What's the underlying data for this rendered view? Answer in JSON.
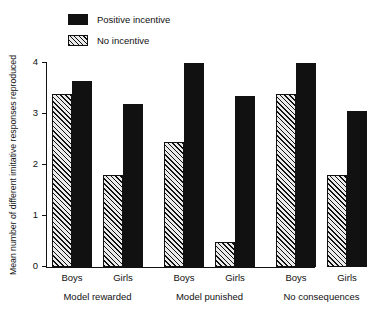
{
  "chart_data": {
    "type": "bar",
    "title": "",
    "subtitle": "",
    "xlabel": "",
    "ylabel": "Mean number of different imitative responses reproduced",
    "ylim": [
      0,
      4
    ],
    "yticks": [
      0,
      1,
      2,
      3,
      4
    ],
    "ytick_labels": [
      "0",
      "1",
      "2",
      "3",
      "4"
    ],
    "grid": false,
    "legend_position": "top-left",
    "categories": [
      "Boys",
      "Girls",
      "Boys",
      "Girls",
      "Boys",
      "Girls"
    ],
    "groups": [
      {
        "label": "Model rewarded",
        "subgroups": [
          {
            "label": "Boys",
            "no_incentive": 3.4,
            "positive_incentive": 3.65
          },
          {
            "label": "Girls",
            "no_incentive": 1.8,
            "positive_incentive": 3.2
          }
        ]
      },
      {
        "label": "Model punished",
        "subgroups": [
          {
            "label": "Boys",
            "no_incentive": 2.45,
            "positive_incentive": 4.0
          },
          {
            "label": "Girls",
            "no_incentive": 0.5,
            "positive_incentive": 3.35
          }
        ]
      },
      {
        "label": "No consequences",
        "subgroups": [
          {
            "label": "Boys",
            "no_incentive": 3.4,
            "positive_incentive": 4.0
          },
          {
            "label": "Girls",
            "no_incentive": 1.8,
            "positive_incentive": 3.05
          }
        ]
      }
    ],
    "series": [
      {
        "name": "No incentive",
        "pattern": "hatched",
        "color": "#ebebeb",
        "values": [
          3.4,
          1.8,
          2.45,
          0.5,
          3.4,
          1.8
        ]
      },
      {
        "name": "Positive incentive",
        "pattern": "solid",
        "color": "#111111",
        "values": [
          3.65,
          3.2,
          4.0,
          3.35,
          4.0,
          3.05
        ]
      }
    ]
  },
  "legend": {
    "entries": [
      {
        "label": "Positive incentive",
        "swatch": "solid"
      },
      {
        "label": "No incentive",
        "swatch": "hatch"
      }
    ]
  },
  "axes": {
    "y_title": "Mean number of different imitative responses reproduced",
    "y_tick_labels": [
      "4",
      "3",
      "2",
      "1",
      "0"
    ],
    "x_tick_labels": [
      "Boys",
      "Girls",
      "Boys",
      "Girls",
      "Boys",
      "Girls"
    ],
    "group_labels": [
      "Model rewarded",
      "Model punished",
      "No consequences"
    ]
  },
  "colors": {
    "ink": "#111111",
    "hatch_fill": "#ebebeb",
    "background": "#ffffff"
  }
}
